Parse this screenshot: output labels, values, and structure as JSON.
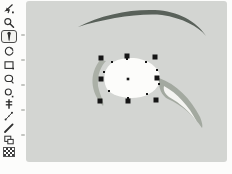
{
  "window": {
    "type": "drawing-editor",
    "background": "#fcfcfb"
  },
  "toolbar": {
    "selected_tool": "eyedropper",
    "tools": [
      {
        "name": "select-arrow"
      },
      {
        "name": "zoom"
      },
      {
        "name": "eyedropper"
      },
      {
        "name": "rotate"
      },
      {
        "name": "rectangle"
      },
      {
        "name": "ellipse"
      },
      {
        "name": "circle"
      },
      {
        "name": "text"
      },
      {
        "name": "polyline"
      },
      {
        "name": "line"
      },
      {
        "name": "duplicate"
      },
      {
        "name": "pattern"
      }
    ]
  },
  "canvas": {
    "colors": {
      "canvas_background": "#d3d5d2",
      "eyebrow": "#59615a",
      "eye_shadow": "#a3a9a0",
      "sclera": "#fcfcfa",
      "handle": "#161616"
    },
    "objects": [
      "eyebrow",
      "eye"
    ],
    "selection": {
      "target": "eye-shape",
      "bounds": {
        "x": 98,
        "y": 54,
        "width": 61,
        "height": 49
      },
      "handles": [
        [
          101,
          58
        ],
        [
          127,
          56
        ],
        [
          155,
          57
        ],
        [
          101,
          79
        ],
        [
          157,
          78
        ],
        [
          100,
          101
        ],
        [
          128,
          101
        ],
        [
          156,
          100
        ]
      ],
      "center": [
        128,
        79
      ],
      "vertices": [
        [
          104,
          72
        ],
        [
          112,
          62
        ],
        [
          127,
          59
        ],
        [
          146,
          62
        ],
        [
          157,
          70
        ],
        [
          159,
          84
        ],
        [
          147,
          94
        ],
        [
          128,
          98
        ],
        [
          109,
          91
        ]
      ]
    }
  }
}
